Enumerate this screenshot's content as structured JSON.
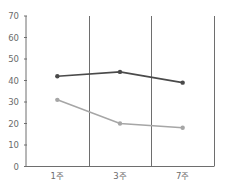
{
  "chart_data": {
    "type": "line",
    "title": "",
    "xlabel": "",
    "ylabel": "",
    "categories": [
      "1주",
      "3주",
      "7주"
    ],
    "series": [
      {
        "name": "series-dark",
        "color": "#4a4a4a",
        "values": [
          42,
          44,
          39
        ]
      },
      {
        "name": "series-light",
        "color": "#a6a6a6",
        "values": [
          31,
          20,
          18
        ]
      }
    ],
    "ylim": [
      0,
      70
    ],
    "yticks": [
      0,
      10,
      20,
      30,
      40,
      50,
      60,
      70
    ],
    "grid": false,
    "legend": "none",
    "separators": "vertical lines between categories"
  }
}
